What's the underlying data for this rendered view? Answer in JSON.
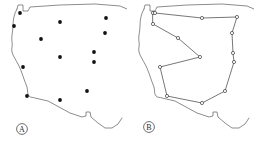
{
  "figure": {
    "width": 254,
    "height": 144,
    "background_color": "#ffffff",
    "type": "two-panel-map-figure",
    "panels": [
      {
        "id": "a",
        "label": "A",
        "label_position": {
          "x": 22,
          "y": 129
        },
        "description": "Western/central United States outline with discrete point locations"
      },
      {
        "id": "b",
        "label": "B",
        "label_position": {
          "x": 22,
          "y": 127
        },
        "description": "Same map outline with the points connected by a closed tour path"
      }
    ]
  },
  "chart_data": {
    "type": "scatter",
    "title": "",
    "subtitle": "",
    "xlabel": "",
    "ylabel": "",
    "grid": false,
    "legend_position": "none",
    "axis_visible": false,
    "xlim": [
      0,
      127
    ],
    "ylim": [
      0,
      144
    ],
    "map_outline_color": "#5b5b5b",
    "point_color": "#121212",
    "edge_color": "#4a4a4a",
    "node_fill_color": "#ffffff",
    "panel_a": {
      "series_name": "site locations",
      "point_count": 13,
      "points": [
        {
          "id": 1,
          "x": 20,
          "y": 13
        },
        {
          "id": 2,
          "x": 14,
          "y": 26
        },
        {
          "id": 3,
          "x": 60,
          "y": 22
        },
        {
          "id": 4,
          "x": 106,
          "y": 18
        },
        {
          "id": 5,
          "x": 41,
          "y": 39
        },
        {
          "id": 6,
          "x": 105,
          "y": 33
        },
        {
          "id": 7,
          "x": 60,
          "y": 57
        },
        {
          "id": 8,
          "x": 94,
          "y": 52
        },
        {
          "id": 9,
          "x": 23,
          "y": 67
        },
        {
          "id": 10,
          "x": 94,
          "y": 62
        },
        {
          "id": 11,
          "x": 87,
          "y": 91
        },
        {
          "id": 12,
          "x": 27,
          "y": 96
        },
        {
          "id": 13,
          "x": 60,
          "y": 100
        }
      ]
    },
    "panel_b": {
      "series_name": "tour path",
      "closed_path": true,
      "node_count": 13,
      "nodes": [
        {
          "id": 1,
          "x": 26,
          "y": 13
        },
        {
          "id": 2,
          "x": 28,
          "y": 13
        },
        {
          "id": 3,
          "x": 75,
          "y": 18
        },
        {
          "id": 4,
          "x": 110,
          "y": 17
        },
        {
          "id": 5,
          "x": 105,
          "y": 33
        },
        {
          "id": 6,
          "x": 106,
          "y": 53
        },
        {
          "id": 7,
          "x": 107,
          "y": 62
        },
        {
          "id": 8,
          "x": 98,
          "y": 91
        },
        {
          "id": 9,
          "x": 75,
          "y": 103
        },
        {
          "id": 10,
          "x": 40,
          "y": 96
        },
        {
          "id": 11,
          "x": 33,
          "y": 67
        },
        {
          "id": 12,
          "x": 73,
          "y": 57
        },
        {
          "id": 13,
          "x": 51,
          "y": 38
        },
        {
          "id": 14,
          "x": 26,
          "y": 24
        }
      ]
    }
  },
  "geometry": {
    "map_outline_path": "M 17,9 L 18,5 L 23,5 L 23,11 L 28,11 L 30,7 L 60,5 L 95,4 L 120,6 L 127,9",
    "map_outline_west": "M 17,9 C 14,14 13,20 13,26 C 13,32 11,36 12,42 C 13,46 11,48 12,52 C 13,56 16,60 19,66 C 22,72 24,80 27,87 C 28,91 27,94 29,96 C 31,98 33,97 35,98 L 48,101 L 70,113 L 82,117 L 86,116 L 86,112 L 90,112 L 91,117 L 98,123 L 105,128 L 112,128 L 118,124 L 122,118",
    "notes": "Stylized outline of the western and central contiguous United States: northern border across the top, Pacific coast down the left, Mexican border and Gulf coast across the bottom"
  },
  "styles": {
    "dot_radius": 1.9,
    "node_radius": 1.6,
    "badge_radius": 5.4,
    "outline_stroke_width": 0.7,
    "edge_stroke_width": 0.75
  }
}
